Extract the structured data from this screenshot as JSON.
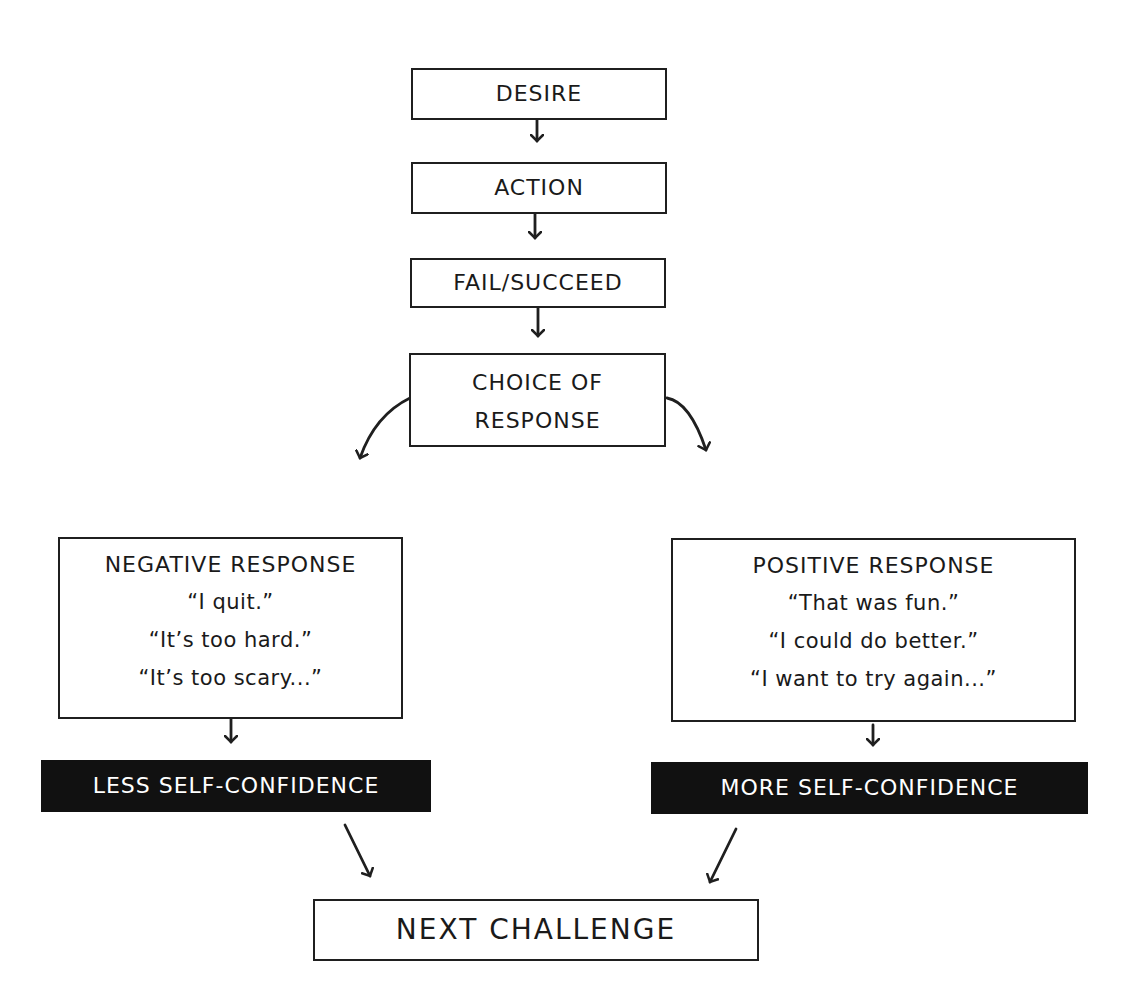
{
  "nodes": {
    "desire": {
      "label": "DESIRE"
    },
    "action": {
      "label": "ACTION"
    },
    "fail_succeed": {
      "label": "FAIL/SUCCEED"
    },
    "choice": {
      "line1": "CHOICE OF",
      "line2": "RESPONSE"
    },
    "negative": {
      "title": "NEGATIVE RESPONSE",
      "quotes": [
        "“I quit.”",
        "“It’s too hard.”",
        "“It’s too scary...”"
      ]
    },
    "positive": {
      "title": "POSITIVE RESPONSE",
      "quotes": [
        "“That was fun.”",
        "“I could do better.”",
        "“I want to try again...”"
      ]
    },
    "less_confidence": {
      "label": "LESS SELF-CONFIDENCE"
    },
    "more_confidence": {
      "label": "MORE SELF-CONFIDENCE"
    },
    "next_challenge": {
      "label": "NEXT CHALLENGE"
    }
  },
  "colors": {
    "line": "#1f1f1f",
    "dark_box": "#111111",
    "dark_text": "#ffffff"
  }
}
